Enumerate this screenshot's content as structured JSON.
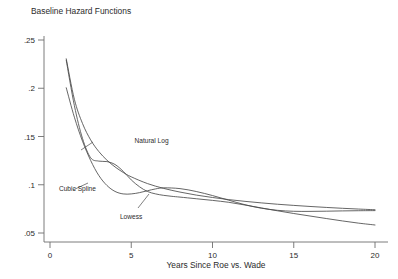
{
  "chart_data": {
    "type": "line",
    "title": "Baseline Hazard Functions",
    "xlabel": "Years Since Roe vs. Wade",
    "ylabel": "",
    "xlim": [
      0,
      20
    ],
    "ylim": [
      0.05,
      0.25
    ],
    "xticks": [
      0,
      5,
      10,
      15,
      20
    ],
    "xtick_labels": [
      "0",
      "5",
      "10",
      "15",
      "20"
    ],
    "yticks": [
      0.05,
      0.1,
      0.15,
      0.2,
      0.25
    ],
    "ytick_labels": [
      ".05",
      ".1",
      ".15",
      ".2",
      ".25"
    ],
    "grid": false,
    "legend_position": "inline-annotations",
    "annotations": [
      {
        "label": "Natural Log",
        "x": 5.2,
        "y": 0.143
      },
      {
        "label": "Cubic Spline",
        "x": 0.55,
        "y": 0.094
      },
      {
        "label": "Lowess",
        "x": 4.3,
        "y": 0.064
      }
    ],
    "series": [
      {
        "name": "Natural Log",
        "x": [
          1,
          1.5,
          2,
          2.5,
          3,
          3.5,
          4,
          4.5,
          5,
          6,
          7,
          8,
          9,
          10,
          11,
          12,
          13,
          14,
          15,
          16,
          17,
          18,
          19,
          20
        ],
        "values": [
          0.2305,
          0.1885,
          0.1635,
          0.1465,
          0.1345,
          0.1255,
          0.1185,
          0.1128,
          0.1082,
          0.1012,
          0.0962,
          0.0924,
          0.0893,
          0.0868,
          0.0846,
          0.0828,
          0.0812,
          0.0798,
          0.0786,
          0.0775,
          0.0765,
          0.0756,
          0.0748,
          0.0741
        ]
      },
      {
        "name": "Cubic Spline",
        "x": [
          1,
          1.5,
          2,
          2.5,
          3,
          3.5,
          4,
          4.5,
          5,
          5.5,
          6,
          6.5,
          7,
          8,
          9,
          10,
          11,
          12,
          13,
          14,
          15,
          16,
          17,
          18,
          19,
          20
        ],
        "values": [
          0.2005,
          0.17,
          0.1452,
          0.1252,
          0.1097,
          0.0993,
          0.0931,
          0.0905,
          0.0905,
          0.0918,
          0.0938,
          0.0957,
          0.0968,
          0.096,
          0.093,
          0.0888,
          0.084,
          0.0793,
          0.0757,
          0.0735,
          0.0725,
          0.0724,
          0.0726,
          0.0729,
          0.0731,
          0.0732
        ]
      },
      {
        "name": "Lowess",
        "x": [
          1,
          1.5,
          2,
          2.5,
          3,
          3.5,
          4,
          4.5,
          5,
          5.5,
          6,
          6.5,
          7,
          7.5,
          8,
          9,
          10,
          11,
          12,
          13,
          14,
          15,
          16,
          17,
          18,
          19,
          20
        ],
        "values": [
          0.229,
          0.182,
          0.148,
          0.128,
          0.1245,
          0.124,
          0.121,
          0.114,
          0.105,
          0.098,
          0.093,
          0.0905,
          0.089,
          0.088,
          0.0872,
          0.0855,
          0.0838,
          0.0818,
          0.079,
          0.076,
          0.073,
          0.0702,
          0.0676,
          0.065,
          0.0625,
          0.0602,
          0.0583
        ]
      }
    ]
  }
}
